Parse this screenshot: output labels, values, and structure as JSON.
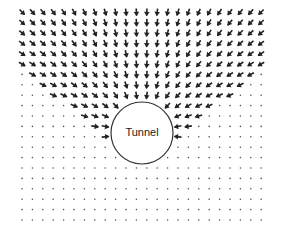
{
  "diagram": {
    "tunnel": {
      "label": "Tunnel",
      "cx": 142,
      "cy": 133,
      "r": 31
    },
    "grid": {
      "x0": 22,
      "y0": 12,
      "dx": 10.4,
      "dy": 10.4,
      "cols": 24,
      "rows": 21
    },
    "colors": {
      "arrow": "#222222",
      "dot": "#555555",
      "outline": "#333333",
      "background": "#ffffff"
    }
  }
}
